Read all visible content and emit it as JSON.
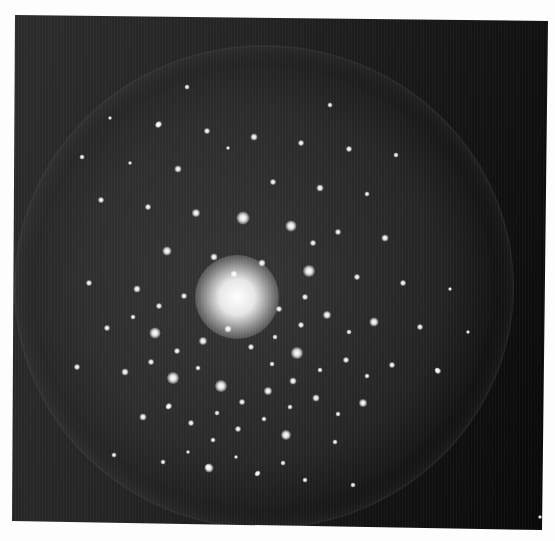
{
  "image": {
    "width": 555,
    "height": 541,
    "subject": "electron diffraction pattern with tenfold-like symmetric arrangement of bright spots",
    "frame_corners": [
      [
        15,
        15
      ],
      [
        548,
        21
      ],
      [
        542,
        530
      ],
      [
        12,
        521
      ]
    ],
    "colors": {
      "page_background": "#fdfdfd",
      "photo_light": "#2c2c2c",
      "photo_dark": "#070707",
      "spot": "#ffffff"
    },
    "halo": {
      "cx": 262,
      "cy": 285,
      "rx": 248,
      "ry": 240
    },
    "center_glow": {
      "cx": 237,
      "cy": 297,
      "r": 42
    },
    "spots": [
      [
        243,
        218,
        13
      ],
      [
        309,
        271,
        12
      ],
      [
        297,
        353,
        12
      ],
      [
        173,
        378,
        12
      ],
      [
        221,
        386,
        12
      ],
      [
        155,
        333,
        11
      ],
      [
        291,
        226,
        11
      ],
      [
        286,
        435,
        10
      ],
      [
        209,
        468,
        9
      ],
      [
        196,
        213,
        8
      ],
      [
        167,
        251,
        9
      ],
      [
        327,
        315,
        8
      ],
      [
        374,
        322,
        9
      ],
      [
        268,
        391,
        8
      ],
      [
        203,
        341,
        8
      ],
      [
        262,
        263,
        7
      ],
      [
        214,
        257,
        7
      ],
      [
        234,
        274,
        7
      ],
      [
        178,
        169,
        7
      ],
      [
        159,
        124,
        6
      ],
      [
        207,
        131,
        6
      ],
      [
        254,
        137,
        7
      ],
      [
        148,
        207,
        6
      ],
      [
        101,
        200,
        6
      ],
      [
        137,
        289,
        7
      ],
      [
        89,
        283,
        6
      ],
      [
        301,
        143,
        6
      ],
      [
        349,
        149,
        6
      ],
      [
        320,
        188,
        7
      ],
      [
        273,
        182,
        6
      ],
      [
        385,
        238,
        7
      ],
      [
        338,
        232,
        6
      ],
      [
        367,
        194,
        5
      ],
      [
        396,
        155,
        5
      ],
      [
        330,
        105,
        5
      ],
      [
        403,
        283,
        6
      ],
      [
        357,
        277,
        6
      ],
      [
        313,
        243,
        6
      ],
      [
        125,
        372,
        7
      ],
      [
        151,
        362,
        6
      ],
      [
        77,
        367,
        6
      ],
      [
        143,
        417,
        7
      ],
      [
        184,
        296,
        6
      ],
      [
        159,
        306,
        6
      ],
      [
        133,
        317,
        5
      ],
      [
        107,
        328,
        6
      ],
      [
        177,
        351,
        6
      ],
      [
        198,
        368,
        5
      ],
      [
        242,
        402,
        6
      ],
      [
        191,
        423,
        6
      ],
      [
        114,
        455,
        5
      ],
      [
        208,
        467,
        6
      ],
      [
        168,
        407,
        5
      ],
      [
        251,
        347,
        6
      ],
      [
        228,
        329,
        7
      ],
      [
        293,
        381,
        7
      ],
      [
        316,
        398,
        7
      ],
      [
        363,
        403,
        8
      ],
      [
        305,
        297,
        6
      ],
      [
        279,
        309,
        6
      ],
      [
        301,
        325,
        6
      ],
      [
        275,
        337,
        5
      ],
      [
        272,
        364,
        5
      ],
      [
        346,
        360,
        6
      ],
      [
        392,
        365,
        6
      ],
      [
        320,
        370,
        5
      ],
      [
        349,
        332,
        5
      ],
      [
        367,
        376,
        5
      ],
      [
        438,
        371,
        6
      ],
      [
        257,
        474,
        5
      ],
      [
        283,
        463,
        5
      ],
      [
        187,
        87,
        5
      ],
      [
        110,
        118,
        4
      ],
      [
        82,
        157,
        5
      ],
      [
        130,
        163,
        4
      ],
      [
        228,
        148,
        4
      ],
      [
        158,
        125,
        6
      ],
      [
        238,
        429,
        6
      ],
      [
        217,
        413,
        5
      ],
      [
        169,
        406,
        6
      ],
      [
        264,
        419,
        5
      ],
      [
        290,
        407,
        5
      ],
      [
        163,
        462,
        5
      ],
      [
        258,
        473,
        5
      ],
      [
        305,
        480,
        5
      ],
      [
        335,
        442,
        5
      ],
      [
        338,
        414,
        5
      ],
      [
        236,
        457,
        4
      ],
      [
        213,
        440,
        5
      ],
      [
        188,
        452,
        4
      ],
      [
        353,
        485,
        5
      ],
      [
        420,
        327,
        6
      ],
      [
        437,
        370,
        5
      ],
      [
        468,
        332,
        4
      ],
      [
        450,
        289,
        4
      ],
      [
        540,
        517,
        4
      ]
    ]
  }
}
